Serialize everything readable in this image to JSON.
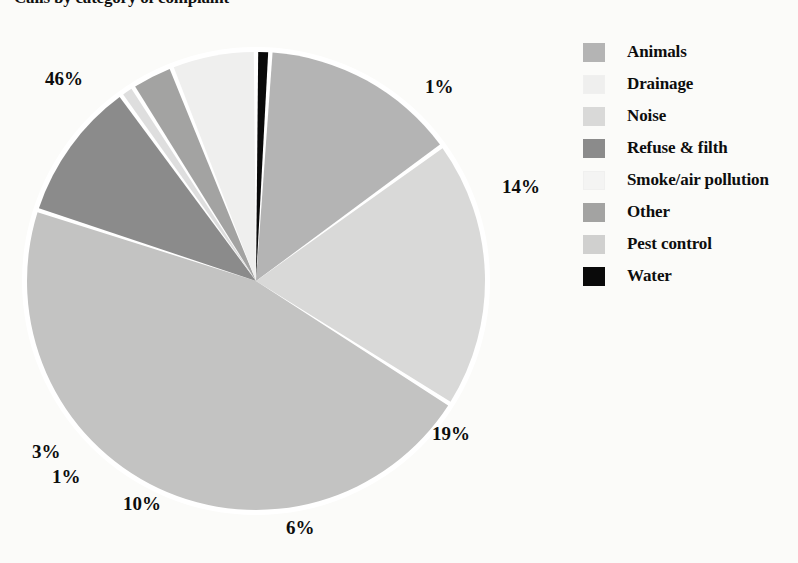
{
  "title": "Calls by category of complaint",
  "chart_data": {
    "type": "pie",
    "title": "Calls by category of complaint",
    "unit": "percent",
    "categories": [
      "Animals",
      "Drainage",
      "Noise",
      "Refuse & filth",
      "Smoke/air pollution",
      "Other",
      "Pest control",
      "Water"
    ],
    "values": [
      14,
      6,
      19,
      10,
      46,
      3,
      1,
      1
    ],
    "colors": [
      "#b4b4b4",
      "#efefee",
      "#d9d9d8",
      "#8b8b8b",
      "#c3c3c2",
      "#a3a3a2",
      "#dedede",
      "#0a0a0a"
    ],
    "slice_labels": [
      "14%",
      "6%",
      "19%",
      "10%",
      "46%",
      "3%",
      "1%",
      "1%"
    ],
    "legend_position": "right",
    "grid": false,
    "start_angle_deg": -90,
    "direction": "clockwise",
    "slice_order_clockwise_from_top": [
      "Water",
      "Animals",
      "Noise",
      "Smoke/air pollution",
      "Refuse & filth",
      "Pest control",
      "Other",
      "Drainage"
    ]
  },
  "pie_labels": {
    "p46": "46%",
    "p1_top": "1%",
    "p14": "14%",
    "p19": "19%",
    "p6": "6%",
    "p10": "10%",
    "p1_left": "1%",
    "p3": "3%"
  },
  "legend": {
    "items": [
      {
        "label": "Animals",
        "color": "#b4b4b4"
      },
      {
        "label": "Drainage",
        "color": "#efefee"
      },
      {
        "label": "Noise",
        "color": "#d9d9d8"
      },
      {
        "label": "Refuse & filth",
        "color": "#8b8b8b"
      },
      {
        "label": "Smoke/air pollution",
        "color": "#f4f4f3"
      },
      {
        "label": "Other",
        "color": "#a3a3a2"
      },
      {
        "label": "Pest control",
        "color": "#d0d0cf"
      },
      {
        "label": "Water",
        "color": "#0a0a0a"
      }
    ]
  }
}
